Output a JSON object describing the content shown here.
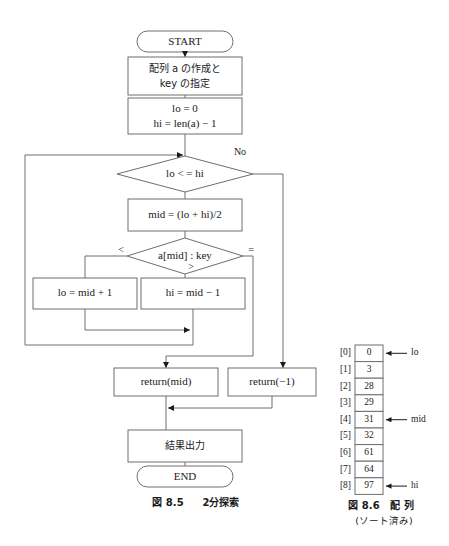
{
  "figure": {
    "flowchart_caption_label": "図 8.5",
    "flowchart_caption_title": "2分探索",
    "array_caption_label": "図 8.6",
    "array_caption_title": "配 列",
    "array_caption_sub": "(ソート済み)"
  },
  "flowchart": {
    "start_label": "START",
    "init_line1": "配列 a の作成と",
    "init_line2": "key の指定",
    "bounds_line1": "lo = 0",
    "bounds_line2": "hi = len(a) − 1",
    "loop_condition": "lo < = hi",
    "loop_no_label": "No",
    "mid_assign": "mid = (lo + hi)/2",
    "compare": "a[mid] : key",
    "branch_less": "<",
    "branch_greater": ">",
    "branch_equal": "=",
    "lo_update": "lo = mid + 1",
    "hi_update": "hi = mid − 1",
    "return_found": "return(mid)",
    "return_notfound": "return(−1)",
    "output": "結果出力",
    "end_label": "END"
  },
  "array_table": {
    "indices": [
      "[0]",
      "[1]",
      "[2]",
      "[3]",
      "[4]",
      "[5]",
      "[6]",
      "[7]",
      "[8]"
    ],
    "values": [
      "0",
      "3",
      "28",
      "29",
      "31",
      "32",
      "61",
      "64",
      "97"
    ],
    "pointers": [
      {
        "row": 0,
        "label": "lo"
      },
      {
        "row": 4,
        "label": "mid"
      },
      {
        "row": 8,
        "label": "hi"
      }
    ]
  },
  "colors": {
    "stroke": "#6e6e6e",
    "text": "#1a1a1a",
    "background": "#ffffff"
  }
}
